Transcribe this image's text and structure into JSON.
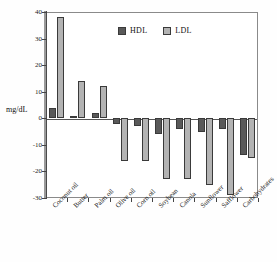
{
  "figure": {
    "ylabel": "mg/dL",
    "caption": ""
  },
  "legend": {
    "position": "top-center",
    "items": [
      {
        "label": "HDL",
        "color": "#595959"
      },
      {
        "label": "LDL",
        "color": "#b3b3b3"
      }
    ]
  },
  "axis": {
    "yticks": [
      "40",
      "30",
      "20",
      "10",
      "0",
      "-10",
      "-20",
      "-30"
    ],
    "ytick_values": [
      40,
      30,
      20,
      10,
      0,
      -10,
      -20,
      -30
    ]
  },
  "chart_data": {
    "type": "bar",
    "title": "",
    "xlabel": "",
    "ylabel": "mg/dL",
    "ylim": [
      -30,
      40
    ],
    "grid": false,
    "legend_position": "top-center",
    "categories": [
      "Coconut oil",
      "Butter",
      "Palm oil",
      "Olive oil",
      "Corn oil",
      "Soybean",
      "Canola",
      "Sunflower",
      "Safflower",
      "Carbohydrates"
    ],
    "series": [
      {
        "name": "HDL",
        "color": "#595959",
        "values": [
          4,
          1,
          2,
          -2,
          -3,
          -6,
          -4,
          -5,
          -4,
          -14
        ]
      },
      {
        "name": "LDL",
        "color": "#b3b3b3",
        "values": [
          38,
          14,
          12,
          -16,
          -16,
          -23,
          -23,
          -25,
          -29,
          -15
        ]
      }
    ]
  }
}
